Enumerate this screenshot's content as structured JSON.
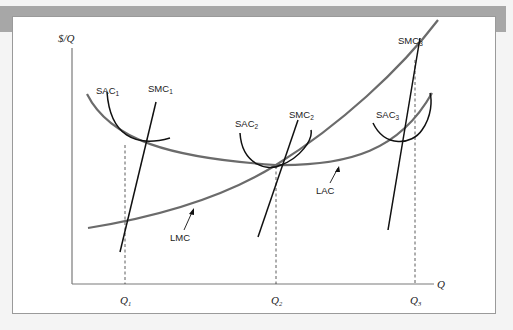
{
  "figure": {
    "y_axis_label": "$/Q",
    "x_axis_label": "Q",
    "x_ticks": [
      {
        "label": "Q",
        "sub": "1"
      },
      {
        "label": "Q",
        "sub": "2"
      },
      {
        "label": "Q",
        "sub": "3"
      }
    ],
    "curves": {
      "lac": {
        "label": "LAC"
      },
      "lmc": {
        "label": "LMC"
      },
      "sac1": {
        "label": "SAC",
        "sub": "1"
      },
      "smc1": {
        "label": "SMC",
        "sub": "1"
      },
      "sac2": {
        "label": "SAC",
        "sub": "2"
      },
      "smc2": {
        "label": "SMC",
        "sub": "2"
      },
      "sac3": {
        "label": "SAC",
        "sub": "3"
      },
      "smc3": {
        "label": "SMC",
        "sub": "3"
      }
    },
    "colors": {
      "long_run": "#6b6b6b",
      "short_run": "#111111",
      "axis": "#7a7a7a",
      "band": "#a7a7a7"
    }
  }
}
